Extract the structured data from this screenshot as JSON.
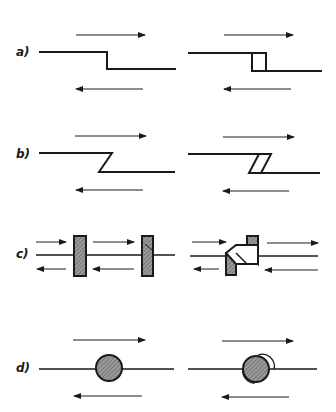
{
  "figure": {
    "rows": [
      {
        "label": "a)",
        "description": "step offset shear: straight joint vs step with gap"
      },
      {
        "label": "b)",
        "description": "angled Z-step shear: single vs double slanted"
      },
      {
        "label": "c)",
        "description": "hatched blocks between parallel flows: aligned vs offset"
      },
      {
        "label": "d)",
        "description": "hatched circle on line: rigid vs rotating with gaps"
      }
    ]
  },
  "colors": {
    "line": "#1a1a1a",
    "hatch_fill": "#8a8a8a",
    "background": "#ffffff"
  }
}
